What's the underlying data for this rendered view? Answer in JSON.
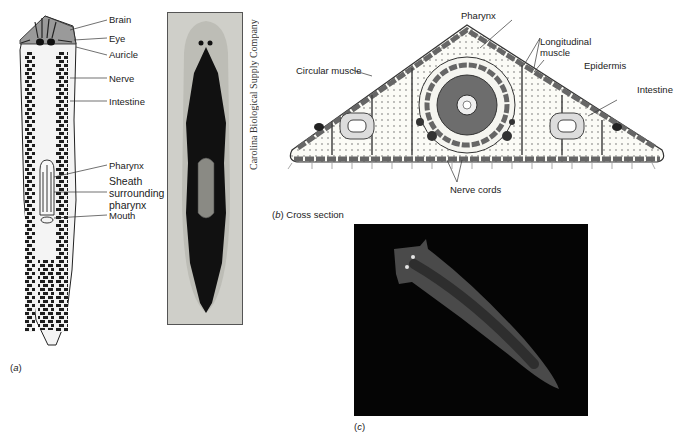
{
  "figure_a": {
    "labels": {
      "brain": "Brain",
      "eye": "Eye",
      "auricle": "Auricle",
      "nerve": "Nerve",
      "intestine": "Intestine",
      "pharynx": "Pharynx",
      "sheath_line1": "Sheath",
      "sheath_line2": "surrounding",
      "sheath_line3": "pharynx",
      "mouth": "Mouth"
    },
    "caption_letter": "a",
    "photo_credit": "Carolina Biological Supply Company"
  },
  "figure_b": {
    "labels": {
      "pharynx": "Pharynx",
      "longitudinal_muscle_line1": "Longitudinal",
      "longitudinal_muscle_line2": "muscle",
      "circular_muscle": "Circular muscle",
      "epidermis": "Epidermis",
      "intestine": "Intestine",
      "nerve_cords": "Nerve cords"
    },
    "caption_letter": "b",
    "caption_text": "Cross section"
  },
  "figure_c": {
    "caption_letter": "c"
  }
}
